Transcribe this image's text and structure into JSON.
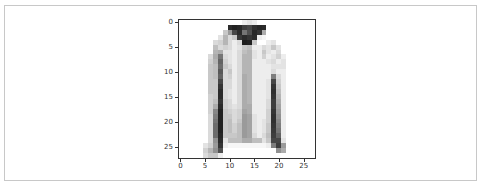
{
  "chart_data": {
    "type": "heatmap",
    "title": "",
    "xlabel": "",
    "ylabel": "",
    "colormap": "gray_r",
    "value_range": [
      0,
      255
    ],
    "xlim": [
      -0.5,
      27.5
    ],
    "ylim": [
      27.5,
      -0.5
    ],
    "x_ticks": [
      0,
      5,
      10,
      15,
      20,
      25
    ],
    "y_ticks": [
      0,
      5,
      10,
      15,
      20,
      25
    ],
    "grid": false,
    "legend": null,
    "rows": 28,
    "cols": 28,
    "values": [
      [
        0,
        0,
        0,
        0,
        0,
        0,
        0,
        0,
        0,
        0,
        0,
        0,
        0,
        20,
        30,
        20,
        0,
        0,
        0,
        0,
        0,
        0,
        0,
        0,
        0,
        0,
        0,
        0
      ],
      [
        0,
        0,
        0,
        0,
        0,
        0,
        0,
        0,
        0,
        0,
        230,
        240,
        235,
        210,
        200,
        225,
        235,
        230,
        0,
        0,
        0,
        0,
        0,
        0,
        0,
        0,
        0,
        0
      ],
      [
        0,
        0,
        0,
        0,
        0,
        0,
        0,
        0,
        0,
        60,
        110,
        200,
        230,
        150,
        190,
        235,
        220,
        90,
        0,
        0,
        0,
        0,
        0,
        0,
        0,
        0,
        0,
        0
      ],
      [
        0,
        0,
        0,
        0,
        0,
        0,
        0,
        0,
        30,
        80,
        40,
        60,
        215,
        230,
        220,
        230,
        20,
        10,
        0,
        0,
        0,
        0,
        0,
        0,
        0,
        0,
        0,
        0
      ],
      [
        0,
        0,
        0,
        0,
        0,
        0,
        0,
        40,
        50,
        80,
        40,
        20,
        40,
        245,
        240,
        60,
        0,
        0,
        20,
        30,
        0,
        0,
        0,
        0,
        0,
        0,
        0,
        0
      ],
      [
        0,
        0,
        0,
        0,
        0,
        0,
        0,
        70,
        40,
        50,
        40,
        20,
        30,
        60,
        70,
        20,
        20,
        40,
        30,
        60,
        30,
        0,
        0,
        0,
        0,
        0,
        0,
        0
      ],
      [
        0,
        0,
        0,
        0,
        0,
        0,
        0,
        80,
        90,
        30,
        30,
        20,
        40,
        70,
        80,
        30,
        20,
        60,
        30,
        20,
        40,
        0,
        0,
        0,
        0,
        0,
        0,
        0
      ],
      [
        0,
        0,
        0,
        0,
        0,
        0,
        40,
        90,
        150,
        40,
        30,
        20,
        40,
        80,
        80,
        30,
        20,
        50,
        20,
        30,
        50,
        20,
        0,
        0,
        0,
        0,
        0,
        0
      ],
      [
        0,
        0,
        0,
        0,
        0,
        0,
        50,
        80,
        170,
        50,
        30,
        20,
        40,
        80,
        80,
        20,
        20,
        20,
        30,
        40,
        20,
        30,
        0,
        0,
        0,
        0,
        0,
        0
      ],
      [
        0,
        0,
        0,
        0,
        0,
        0,
        60,
        70,
        160,
        60,
        40,
        20,
        40,
        80,
        80,
        20,
        20,
        20,
        20,
        30,
        30,
        30,
        0,
        0,
        0,
        0,
        0,
        0
      ],
      [
        0,
        0,
        0,
        0,
        0,
        0,
        60,
        70,
        180,
        40,
        60,
        20,
        40,
        80,
        80,
        20,
        20,
        20,
        20,
        40,
        20,
        20,
        0,
        0,
        0,
        0,
        0,
        0
      ],
      [
        0,
        0,
        0,
        0,
        0,
        0,
        60,
        70,
        170,
        40,
        50,
        20,
        40,
        90,
        80,
        20,
        20,
        20,
        20,
        140,
        40,
        20,
        0,
        0,
        0,
        0,
        0,
        0
      ],
      [
        0,
        0,
        0,
        0,
        0,
        0,
        60,
        60,
        200,
        40,
        40,
        20,
        40,
        90,
        80,
        20,
        20,
        20,
        30,
        200,
        50,
        20,
        0,
        0,
        0,
        0,
        0,
        0
      ],
      [
        0,
        0,
        0,
        0,
        0,
        0,
        60,
        60,
        220,
        40,
        40,
        20,
        40,
        90,
        80,
        20,
        20,
        20,
        30,
        220,
        60,
        20,
        0,
        0,
        0,
        0,
        0,
        0
      ],
      [
        0,
        0,
        0,
        0,
        0,
        0,
        60,
        60,
        230,
        40,
        30,
        20,
        40,
        90,
        80,
        20,
        20,
        20,
        30,
        225,
        70,
        20,
        0,
        0,
        0,
        0,
        0,
        0
      ],
      [
        0,
        0,
        0,
        0,
        0,
        0,
        50,
        60,
        230,
        40,
        30,
        20,
        40,
        90,
        80,
        20,
        20,
        20,
        30,
        220,
        80,
        20,
        0,
        0,
        0,
        0,
        0,
        0
      ],
      [
        0,
        0,
        0,
        0,
        0,
        0,
        50,
        70,
        220,
        50,
        40,
        20,
        40,
        90,
        80,
        20,
        20,
        20,
        40,
        210,
        90,
        20,
        0,
        0,
        0,
        0,
        0,
        0
      ],
      [
        0,
        0,
        0,
        0,
        0,
        0,
        50,
        90,
        230,
        50,
        40,
        30,
        40,
        90,
        90,
        20,
        20,
        20,
        40,
        210,
        100,
        20,
        0,
        0,
        0,
        0,
        0,
        0
      ],
      [
        0,
        0,
        0,
        0,
        0,
        0,
        50,
        130,
        240,
        60,
        50,
        40,
        50,
        100,
        90,
        20,
        20,
        20,
        50,
        220,
        110,
        20,
        0,
        0,
        0,
        0,
        0,
        0
      ],
      [
        0,
        0,
        0,
        0,
        0,
        0,
        40,
        140,
        240,
        60,
        60,
        40,
        50,
        110,
        100,
        30,
        20,
        20,
        50,
        225,
        120,
        20,
        0,
        0,
        0,
        0,
        0,
        0
      ],
      [
        0,
        0,
        0,
        0,
        0,
        0,
        40,
        150,
        240,
        60,
        70,
        40,
        60,
        110,
        100,
        30,
        20,
        30,
        50,
        225,
        130,
        20,
        0,
        0,
        0,
        0,
        0,
        0
      ],
      [
        0,
        0,
        0,
        0,
        0,
        0,
        40,
        160,
        240,
        60,
        70,
        50,
        70,
        110,
        100,
        30,
        20,
        30,
        60,
        220,
        140,
        20,
        0,
        0,
        0,
        0,
        0,
        0
      ],
      [
        0,
        0,
        0,
        0,
        0,
        0,
        40,
        160,
        240,
        60,
        70,
        50,
        70,
        110,
        100,
        30,
        20,
        30,
        60,
        215,
        150,
        20,
        0,
        0,
        0,
        0,
        0,
        0
      ],
      [
        0,
        0,
        0,
        0,
        0,
        0,
        40,
        160,
        235,
        60,
        60,
        60,
        70,
        110,
        100,
        40,
        20,
        40,
        70,
        210,
        170,
        20,
        0,
        0,
        0,
        0,
        0,
        0
      ],
      [
        0,
        0,
        0,
        0,
        0,
        0,
        40,
        120,
        230,
        30,
        70,
        70,
        70,
        90,
        90,
        70,
        70,
        30,
        60,
        200,
        200,
        30,
        0,
        0,
        0,
        0,
        0,
        0
      ],
      [
        0,
        0,
        0,
        0,
        0,
        30,
        50,
        110,
        220,
        20,
        10,
        10,
        10,
        10,
        10,
        10,
        10,
        10,
        20,
        140,
        210,
        110,
        0,
        0,
        0,
        0,
        0,
        0
      ],
      [
        0,
        0,
        0,
        0,
        0,
        50,
        80,
        120,
        190,
        0,
        0,
        0,
        0,
        0,
        0,
        0,
        0,
        0,
        0,
        0,
        120,
        90,
        0,
        0,
        0,
        0,
        0,
        0
      ],
      [
        0,
        0,
        0,
        0,
        0,
        40,
        60,
        60,
        20,
        0,
        0,
        0,
        0,
        0,
        0,
        0,
        0,
        0,
        0,
        0,
        0,
        0,
        0,
        0,
        0,
        0,
        0,
        0
      ]
    ]
  },
  "axes": {
    "x_tick_labels": [
      "0",
      "5",
      "10",
      "15",
      "20",
      "25"
    ],
    "y_tick_labels": [
      "0",
      "5",
      "10",
      "15",
      "20",
      "25"
    ]
  }
}
